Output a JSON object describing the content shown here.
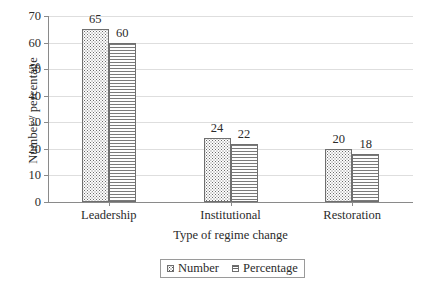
{
  "chart_data": {
    "type": "bar",
    "title": "",
    "subtitle": "",
    "xlabel": "Type of regime change",
    "ylabel": "Number / percentage",
    "categories": [
      "Leadership",
      "Institutional",
      "Restoration"
    ],
    "series": [
      {
        "name": "Number",
        "values": [
          65,
          24,
          20
        ],
        "pattern": "dots"
      },
      {
        "name": "Percentage",
        "values": [
          60,
          22,
          18
        ],
        "pattern": "horizontal-lines"
      }
    ],
    "ylim": [
      0,
      70
    ],
    "yticks": [
      0,
      10,
      20,
      30,
      40,
      50,
      60,
      70
    ],
    "ytick_labels": [
      "0",
      "10",
      "20",
      "30",
      "40",
      "50",
      "60",
      "70"
    ],
    "grid": true,
    "grid_axis": "y",
    "legend_position": "bottom-center",
    "data_labels": true,
    "background_color": "#ffffff",
    "gridline_color": "#dedede",
    "axis_color": "#8a8a8a",
    "text_color": "#2b2b2b",
    "bar_outline_color": "#6f6f6f"
  }
}
